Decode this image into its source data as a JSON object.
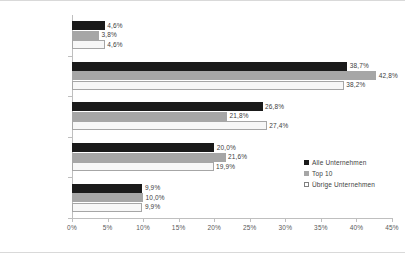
{
  "chart_data": {
    "type": "bar",
    "orientation": "horizontal",
    "title": "",
    "subtitle": "",
    "xlabel": "",
    "ylabel": "",
    "xlim": [
      0,
      45
    ],
    "grid": false,
    "legend_position": "right-middle",
    "categories": [
      "unter 20 Jahre",
      "20 bis 29 Jahre",
      "30 bis 39 Jahre",
      "40 bis 49 Jahre",
      "über 50 Jahre"
    ],
    "xtick_labels": [
      "0%",
      "5%",
      "10%",
      "15%",
      "20%",
      "25%",
      "30%",
      "35%",
      "40%",
      "45%"
    ],
    "xtick_values": [
      0,
      5,
      10,
      15,
      20,
      25,
      30,
      35,
      40,
      45
    ],
    "series": [
      {
        "name": "Alle Unternehmen",
        "color": "#1a1a1a",
        "values": [
          4.6,
          38.7,
          26.8,
          20.0,
          9.9
        ],
        "labels": [
          "4,6%",
          "38,7%",
          "26,8%",
          "20,0%",
          "9,9%"
        ]
      },
      {
        "name": "Top 10",
        "color": "#a6a6a6",
        "values": [
          3.8,
          42.8,
          21.8,
          21.6,
          10.0
        ],
        "labels": [
          "3,8%",
          "42,8%",
          "21,8%",
          "21,6%",
          "10,0%"
        ]
      },
      {
        "name": "Übrige Unternehmen",
        "color": "#f7f7f7",
        "values": [
          4.6,
          38.2,
          27.4,
          19.9,
          9.9
        ],
        "labels": [
          "4,6%",
          "38,2%",
          "27,4%",
          "19,9%",
          "9,9%"
        ]
      }
    ]
  }
}
